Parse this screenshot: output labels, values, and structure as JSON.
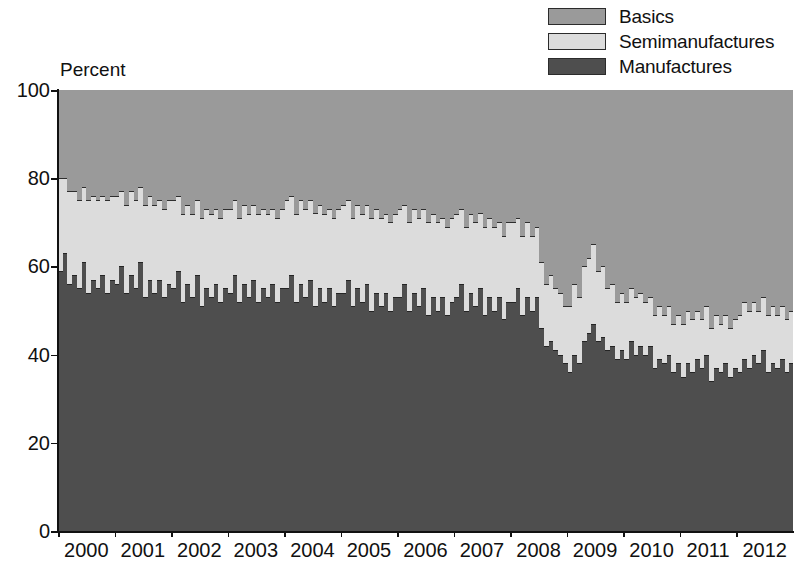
{
  "chart_data": {
    "type": "bar",
    "subtype": "stacked-100-percent",
    "title": "",
    "xlabel": "",
    "ylabel": "Percent",
    "ylim": [
      0,
      100
    ],
    "yticks": [
      0,
      20,
      40,
      60,
      80,
      100
    ],
    "grid": false,
    "legend_position": "top-right",
    "bar_frequency": "monthly",
    "categories": [
      "2000-01",
      "2000-02",
      "2000-03",
      "2000-04",
      "2000-05",
      "2000-06",
      "2000-07",
      "2000-08",
      "2000-09",
      "2000-10",
      "2000-11",
      "2000-12",
      "2001-01",
      "2001-02",
      "2001-03",
      "2001-04",
      "2001-05",
      "2001-06",
      "2001-07",
      "2001-08",
      "2001-09",
      "2001-10",
      "2001-11",
      "2001-12",
      "2002-01",
      "2002-02",
      "2002-03",
      "2002-04",
      "2002-05",
      "2002-06",
      "2002-07",
      "2002-08",
      "2002-09",
      "2002-10",
      "2002-11",
      "2002-12",
      "2003-01",
      "2003-02",
      "2003-03",
      "2003-04",
      "2003-05",
      "2003-06",
      "2003-07",
      "2003-08",
      "2003-09",
      "2003-10",
      "2003-11",
      "2003-12",
      "2004-01",
      "2004-02",
      "2004-03",
      "2004-04",
      "2004-05",
      "2004-06",
      "2004-07",
      "2004-08",
      "2004-09",
      "2004-10",
      "2004-11",
      "2004-12",
      "2005-01",
      "2005-02",
      "2005-03",
      "2005-04",
      "2005-05",
      "2005-06",
      "2005-07",
      "2005-08",
      "2005-09",
      "2005-10",
      "2005-11",
      "2005-12",
      "2006-01",
      "2006-02",
      "2006-03",
      "2006-04",
      "2006-05",
      "2006-06",
      "2006-07",
      "2006-08",
      "2006-09",
      "2006-10",
      "2006-11",
      "2006-12",
      "2007-01",
      "2007-02",
      "2007-03",
      "2007-04",
      "2007-05",
      "2007-06",
      "2007-07",
      "2007-08",
      "2007-09",
      "2007-10",
      "2007-11",
      "2007-12",
      "2008-01",
      "2008-02",
      "2008-03",
      "2008-04",
      "2008-05",
      "2008-06",
      "2008-07",
      "2008-08",
      "2008-09",
      "2008-10",
      "2008-11",
      "2008-12",
      "2009-01",
      "2009-02",
      "2009-03",
      "2009-04",
      "2009-05",
      "2009-06",
      "2009-07",
      "2009-08",
      "2009-09",
      "2009-10",
      "2009-11",
      "2009-12",
      "2010-01",
      "2010-02",
      "2010-03",
      "2010-04",
      "2010-05",
      "2010-06",
      "2010-07",
      "2010-08",
      "2010-09",
      "2010-10",
      "2010-11",
      "2010-12",
      "2011-01",
      "2011-02",
      "2011-03",
      "2011-04",
      "2011-05",
      "2011-06",
      "2011-07",
      "2011-08",
      "2011-09",
      "2011-10",
      "2011-11",
      "2011-12",
      "2012-01",
      "2012-02",
      "2012-03",
      "2012-04",
      "2012-05",
      "2012-06",
      "2012-07",
      "2012-08",
      "2012-09",
      "2012-10",
      "2012-11",
      "2012-12"
    ],
    "xtick_labels": [
      "2000",
      "2001",
      "2002",
      "2003",
      "2004",
      "2005",
      "2006",
      "2007",
      "2008",
      "2009",
      "2010",
      "2011",
      "2012"
    ],
    "series": [
      {
        "name": "Manufactures",
        "color": "#4e4e4e",
        "values": [
          59,
          63,
          56,
          58,
          55,
          61,
          54,
          57,
          55,
          58,
          54,
          57,
          56,
          60,
          54,
          58,
          55,
          61,
          53,
          57,
          54,
          57,
          53,
          56,
          55,
          59,
          52,
          56,
          53,
          58,
          51,
          55,
          53,
          56,
          52,
          55,
          54,
          58,
          52,
          56,
          53,
          57,
          52,
          55,
          53,
          56,
          52,
          55,
          55,
          58,
          52,
          56,
          53,
          57,
          51,
          55,
          52,
          55,
          51,
          54,
          54,
          57,
          51,
          55,
          52,
          56,
          50,
          54,
          51,
          54,
          50,
          53,
          53,
          56,
          50,
          54,
          51,
          55,
          49,
          53,
          50,
          53,
          49,
          52,
          53,
          56,
          50,
          54,
          51,
          55,
          49,
          53,
          50,
          53,
          48,
          52,
          52,
          55,
          49,
          53,
          50,
          53,
          46,
          42,
          43,
          41,
          40,
          38,
          36,
          40,
          38,
          43,
          45,
          47,
          43,
          44,
          41,
          42,
          39,
          41,
          39,
          43,
          40,
          42,
          40,
          42,
          37,
          39,
          38,
          40,
          36,
          38,
          35,
          38,
          36,
          39,
          37,
          40,
          34,
          37,
          36,
          38,
          35,
          37,
          36,
          39,
          37,
          40,
          38,
          41,
          36,
          38,
          37,
          39,
          36,
          38
        ]
      },
      {
        "name": "Semimanufactures",
        "color": "#dcdcdc",
        "values": [
          21,
          17,
          21,
          19,
          20,
          17,
          21,
          19,
          20,
          18,
          21,
          19,
          20,
          17,
          20,
          19,
          20,
          17,
          21,
          19,
          20,
          18,
          20,
          19,
          20,
          17,
          20,
          18,
          19,
          17,
          20,
          18,
          19,
          17,
          19,
          18,
          19,
          17,
          19,
          18,
          19,
          17,
          20,
          18,
          19,
          17,
          19,
          18,
          20,
          18,
          20,
          19,
          20,
          18,
          21,
          19,
          20,
          18,
          20,
          19,
          20,
          18,
          20,
          19,
          20,
          18,
          21,
          19,
          20,
          18,
          20,
          19,
          20,
          18,
          20,
          19,
          20,
          18,
          21,
          19,
          20,
          18,
          20,
          19,
          19,
          17,
          19,
          18,
          19,
          17,
          20,
          18,
          19,
          17,
          19,
          18,
          18,
          16,
          18,
          17,
          17,
          16,
          15,
          14,
          15,
          14,
          14,
          13,
          15,
          16,
          15,
          17,
          17,
          18,
          16,
          16,
          14,
          14,
          13,
          13,
          13,
          12,
          13,
          12,
          12,
          11,
          12,
          12,
          11,
          11,
          11,
          11,
          12,
          12,
          12,
          11,
          11,
          11,
          12,
          12,
          11,
          11,
          11,
          11,
          13,
          13,
          13,
          12,
          12,
          12,
          13,
          13,
          12,
          12,
          12,
          12
        ]
      },
      {
        "name": "Basics",
        "color": "#9a9a9a",
        "values": [
          20,
          20,
          23,
          23,
          25,
          22,
          25,
          24,
          25,
          24,
          25,
          24,
          24,
          23,
          26,
          23,
          25,
          22,
          26,
          24,
          26,
          25,
          27,
          25,
          25,
          24,
          28,
          26,
          28,
          25,
          29,
          27,
          28,
          27,
          29,
          27,
          27,
          25,
          29,
          26,
          28,
          26,
          28,
          27,
          28,
          27,
          29,
          27,
          25,
          24,
          28,
          25,
          27,
          25,
          28,
          26,
          28,
          27,
          29,
          27,
          26,
          25,
          29,
          26,
          28,
          26,
          29,
          27,
          29,
          28,
          30,
          28,
          27,
          26,
          30,
          27,
          29,
          27,
          30,
          28,
          30,
          29,
          31,
          29,
          28,
          27,
          31,
          28,
          30,
          28,
          31,
          29,
          31,
          30,
          33,
          30,
          30,
          29,
          33,
          30,
          33,
          31,
          39,
          44,
          42,
          45,
          46,
          49,
          49,
          44,
          47,
          40,
          38,
          35,
          41,
          40,
          45,
          44,
          48,
          46,
          48,
          45,
          47,
          46,
          48,
          47,
          51,
          49,
          51,
          49,
          53,
          51,
          53,
          50,
          52,
          50,
          52,
          49,
          54,
          51,
          53,
          51,
          54,
          52,
          51,
          48,
          50,
          48,
          50,
          47,
          51,
          49,
          51,
          49,
          52,
          50
        ]
      }
    ]
  },
  "legend": {
    "items": [
      {
        "label": "Basics",
        "color": "#9a9a9a"
      },
      {
        "label": "Semimanufactures",
        "color": "#dcdcdc"
      },
      {
        "label": "Manufactures",
        "color": "#4e4e4e"
      }
    ]
  },
  "axes": {
    "y_label": "Percent",
    "y_ticks": [
      "100",
      "80",
      "60",
      "40",
      "20",
      "0"
    ],
    "x_ticks": [
      "2000",
      "2001",
      "2002",
      "2003",
      "2004",
      "2005",
      "2006",
      "2007",
      "2008",
      "2009",
      "2010",
      "2011",
      "2012"
    ]
  }
}
